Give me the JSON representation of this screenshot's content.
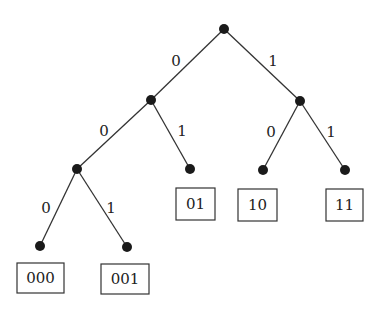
{
  "diagram": {
    "type": "binary-tree",
    "nodes": [
      {
        "id": "root",
        "x": 224,
        "y": 29
      },
      {
        "id": "n0",
        "x": 151,
        "y": 100
      },
      {
        "id": "n1",
        "x": 300,
        "y": 101
      },
      {
        "id": "n00",
        "x": 77,
        "y": 169
      },
      {
        "id": "n01",
        "x": 190,
        "y": 169
      },
      {
        "id": "n10",
        "x": 263,
        "y": 170
      },
      {
        "id": "n11",
        "x": 345,
        "y": 170
      },
      {
        "id": "n000",
        "x": 40,
        "y": 246
      },
      {
        "id": "n001",
        "x": 127,
        "y": 247
      }
    ],
    "edges": [
      {
        "from": "root",
        "to": "n0",
        "label": "0",
        "lx": 176,
        "ly": 62
      },
      {
        "from": "root",
        "to": "n1",
        "label": "1",
        "lx": 273,
        "ly": 62
      },
      {
        "from": "n0",
        "to": "n00",
        "label": "0",
        "lx": 104,
        "ly": 132
      },
      {
        "from": "n0",
        "to": "n01",
        "label": "1",
        "lx": 182,
        "ly": 132
      },
      {
        "from": "n1",
        "to": "n10",
        "label": "0",
        "lx": 271,
        "ly": 133
      },
      {
        "from": "n1",
        "to": "n11",
        "label": "1",
        "lx": 331,
        "ly": 133
      },
      {
        "from": "n00",
        "to": "n000",
        "label": "0",
        "lx": 46,
        "ly": 209
      },
      {
        "from": "n00",
        "to": "n001",
        "label": "1",
        "lx": 111,
        "ly": 209
      }
    ],
    "leaves": [
      {
        "node": "n01",
        "code": "01",
        "bx": 176,
        "by": 188,
        "bw": 39,
        "bh": 32
      },
      {
        "node": "n10",
        "code": "10",
        "bx": 238,
        "by": 189,
        "bw": 39,
        "bh": 32
      },
      {
        "node": "n11",
        "code": "11",
        "bx": 326,
        "by": 189,
        "bw": 37,
        "bh": 32
      },
      {
        "node": "n000",
        "code": "000",
        "bx": 17,
        "by": 263,
        "bw": 47,
        "bh": 30
      },
      {
        "node": "n001",
        "code": "001",
        "bx": 101,
        "by": 264,
        "bw": 48,
        "bh": 30
      }
    ]
  }
}
